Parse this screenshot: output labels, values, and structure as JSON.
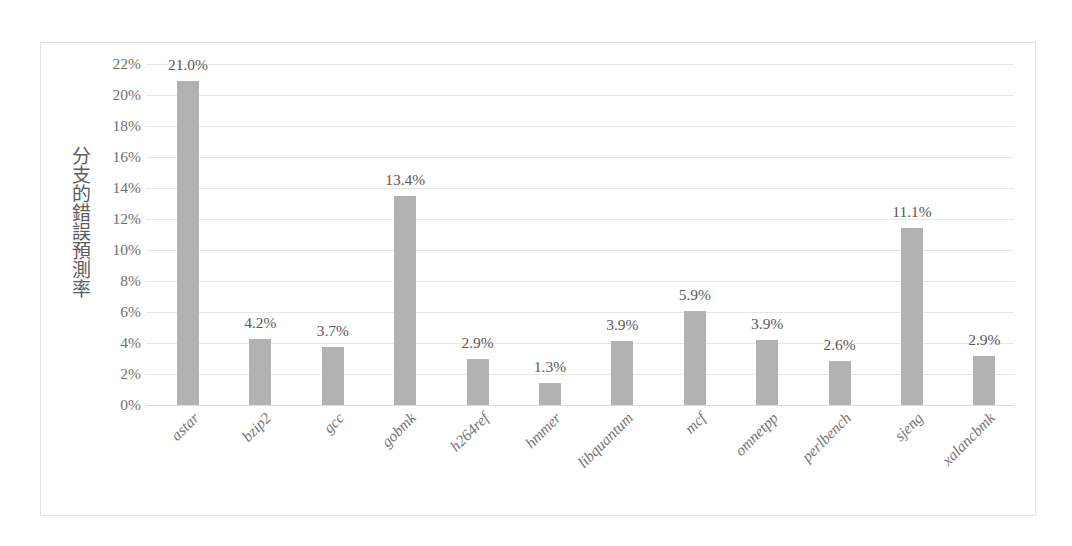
{
  "chart_data": {
    "type": "bar",
    "title": "",
    "subtitle": "",
    "xlabel": "",
    "ylabel": "分支的錯誤預測率",
    "ylim": [
      0,
      22
    ],
    "y_tick_step": 2,
    "y_ticks": [
      "0%",
      "2%",
      "4%",
      "6%",
      "8%",
      "10%",
      "12%",
      "14%",
      "16%",
      "18%",
      "20%",
      "22%"
    ],
    "y_tick_values": [
      0,
      2,
      4,
      6,
      8,
      10,
      12,
      14,
      16,
      18,
      20,
      22
    ],
    "grid": true,
    "legend": false,
    "legend_position": "none",
    "value_suffix": "%",
    "bar_color": "#b2b2b2",
    "gridline_color": "#e8e8e8",
    "categories": [
      "astar",
      "bzip2",
      "gcc",
      "gobmk",
      "h264ref",
      "hmmer",
      "libquantum",
      "mcf",
      "omnetpp",
      "perlbench",
      "sjeng",
      "xalancbmk"
    ],
    "values": [
      21.0,
      4.2,
      3.7,
      13.4,
      2.9,
      1.3,
      3.9,
      5.9,
      3.9,
      2.6,
      11.1,
      2.9
    ],
    "drawn_values": [
      20.9,
      4.25,
      3.75,
      13.5,
      3.0,
      1.45,
      4.15,
      6.05,
      4.2,
      2.85,
      11.4,
      3.15
    ],
    "data_labels": [
      "21.0%",
      "4.2%",
      "3.7%",
      "13.4%",
      "2.9%",
      "1.3%",
      "3.9%",
      "5.9%",
      "3.9%",
      "2.6%",
      "11.1%",
      "2.9%"
    ]
  }
}
